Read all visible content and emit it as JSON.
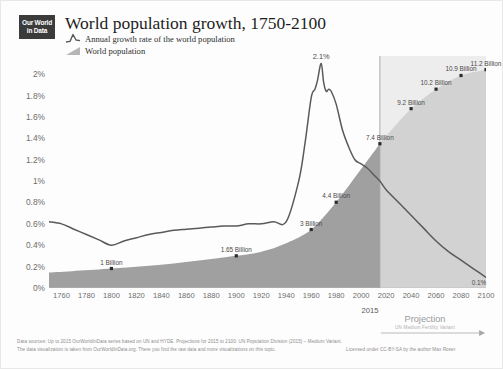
{
  "logo": {
    "line1": "Our World",
    "line2": "in Data"
  },
  "header": {
    "title": "World population growth, 1750-2100",
    "legend": [
      {
        "label": "Annual growth rate of the world population",
        "icon": "line-peak-icon",
        "color": "#5a5a5a"
      },
      {
        "label": "World population",
        "icon": "area-wedge-icon",
        "color": "#a9a9a9"
      }
    ]
  },
  "projection": {
    "divider_year": "2015",
    "title": "Projection",
    "subtitle": "UN Medium Fertility Variant"
  },
  "footer": {
    "line1": "Data sources:  Up to 2015 OurWorldInData series based on UN and HYDE. Projections for 2015 to 2100: UN Population Division (2015) – Medium Variant.",
    "line2": "The data visualization is taken from OurWorldInData.org. There you find the raw data and more visualizations on this topic.",
    "license": "Licensed under CC-BY-SA by the author Max Roser."
  },
  "chart_data": {
    "type": "line",
    "title": "World population growth, 1750-2100",
    "xlabel": "",
    "ylabel": "",
    "xlim": [
      1750,
      2100
    ],
    "ylim": [
      0,
      2.1
    ],
    "grid": false,
    "legend_position": "top-left",
    "y_ticks": [
      "0%",
      "0.2%",
      "0.4%",
      "0.6%",
      "0.8%",
      "1%",
      "1.2%",
      "1.4%",
      "1.6%",
      "1.8%",
      "2%"
    ],
    "y_tick_values": [
      0,
      0.2,
      0.4,
      0.6,
      0.8,
      1.0,
      1.2,
      1.4,
      1.6,
      1.8,
      2.0
    ],
    "x_ticks": [
      "1760",
      "1780",
      "1800",
      "1820",
      "1840",
      "1860",
      "1880",
      "1900",
      "1920",
      "1940",
      "1960",
      "1980",
      "2000",
      "2020",
      "2040",
      "2060",
      "2080",
      "2100"
    ],
    "x_tick_values": [
      1760,
      1780,
      1800,
      1820,
      1840,
      1860,
      1880,
      1900,
      1920,
      1940,
      1960,
      1980,
      2000,
      2020,
      2040,
      2060,
      2080,
      2100
    ],
    "series": [
      {
        "name": "Annual growth rate of the world population",
        "type": "line",
        "color": "#5a5a5a",
        "unit": "%",
        "x": [
          1750,
          1760,
          1770,
          1780,
          1790,
          1800,
          1810,
          1820,
          1830,
          1840,
          1850,
          1860,
          1870,
          1880,
          1890,
          1900,
          1910,
          1920,
          1930,
          1940,
          1950,
          1955,
          1960,
          1963,
          1965,
          1968,
          1970,
          1972,
          1974,
          1976,
          1980,
          1985,
          1990,
          1995,
          2000,
          2005,
          2010,
          2015,
          2020,
          2030,
          2040,
          2050,
          2060,
          2070,
          2080,
          2090,
          2100
        ],
        "y": [
          0.62,
          0.6,
          0.55,
          0.5,
          0.45,
          0.4,
          0.44,
          0.47,
          0.5,
          0.52,
          0.54,
          0.55,
          0.56,
          0.57,
          0.58,
          0.58,
          0.6,
          0.6,
          0.62,
          0.62,
          1.0,
          1.35,
          1.78,
          1.86,
          1.94,
          2.1,
          1.92,
          1.84,
          1.86,
          1.84,
          1.72,
          1.48,
          1.32,
          1.2,
          1.16,
          1.12,
          1.06,
          1.0,
          0.92,
          0.8,
          0.68,
          0.56,
          0.44,
          0.34,
          0.26,
          0.18,
          0.1
        ]
      },
      {
        "name": "World population",
        "type": "area",
        "color_historical": "#a0a0a0",
        "color_projection": "#d2d2d2",
        "unit": "Billion",
        "x": [
          1750,
          1800,
          1850,
          1900,
          1920,
          1940,
          1960,
          1980,
          2000,
          2015,
          2020,
          2040,
          2060,
          2080,
          2100
        ],
        "y": [
          0.79,
          1.0,
          1.26,
          1.65,
          1.86,
          2.3,
          3.0,
          4.4,
          6.1,
          7.4,
          7.8,
          9.2,
          10.2,
          10.9,
          11.2
        ]
      }
    ],
    "annotations": [
      {
        "x": 1968,
        "value": "2.1%",
        "series": "growth-rate",
        "kind": "peak"
      },
      {
        "x": 1800,
        "value": "1 Billion",
        "series": "population"
      },
      {
        "x": 1900,
        "value": "1.65 Billion",
        "series": "population"
      },
      {
        "x": 1960,
        "value": "3 Billion",
        "series": "population"
      },
      {
        "x": 1980,
        "value": "4.4 Billion",
        "series": "population"
      },
      {
        "x": 2015,
        "value": "7.4 Billion",
        "series": "population"
      },
      {
        "x": 2040,
        "value": "9.2 Billion",
        "series": "population"
      },
      {
        "x": 2060,
        "value": "10.2 Billion",
        "series": "population"
      },
      {
        "x": 2080,
        "value": "10.9 Billion",
        "series": "population"
      },
      {
        "x": 2100,
        "value": "11.2 Billion",
        "series": "population"
      },
      {
        "x": 2100,
        "value": "0.1%",
        "series": "growth-rate"
      }
    ]
  }
}
